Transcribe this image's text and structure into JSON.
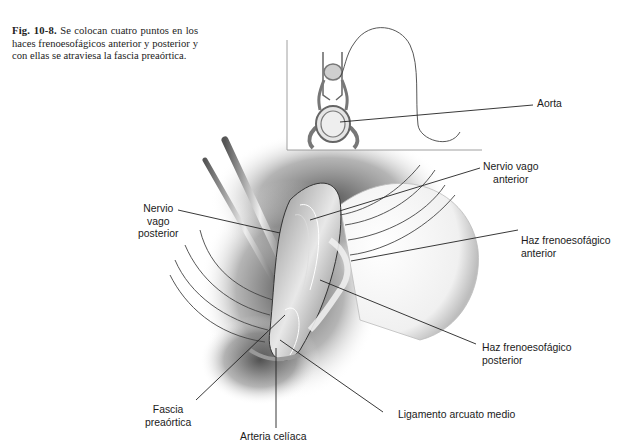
{
  "figure": {
    "caption": {
      "number": "Fig. 10-8.",
      "text": " Se colocan cuatro puntos en los haces frenoesofágicos anterior y posterior y con ellas se atraviesa la fascia preaórtica."
    },
    "labels": {
      "aorta": "Aorta",
      "nervio_vago_anterior": "Nervio vago\nanterior",
      "nervio_vago_posterior": "Nervio\nvago\nposterior",
      "haz_frenoesofagico_anterior": "Haz frenoesofágico\nanterior",
      "haz_frenoesofagico_posterior": "Haz frenoesofágico\nposterior",
      "fascia_preaortica": "Fascia\npreaórtica",
      "arteria_celiaca": "Arteria celíaca",
      "ligamento_arcuato_medio": "Ligamento arcuato medio"
    },
    "colors": {
      "ink": "#1a1a1a",
      "shadow": "#5a5a5a",
      "tissue_light": "#d9d9d9",
      "background": "#ffffff"
    }
  }
}
